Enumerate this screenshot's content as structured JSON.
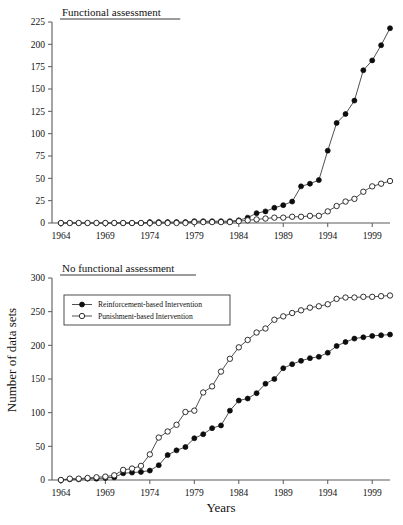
{
  "figure": {
    "ylabel": "Number of data sets",
    "xlabel": "Years"
  },
  "legend": {
    "items": [
      {
        "label": "Reinforcement-based Intervention",
        "marker": "filled-circle"
      },
      {
        "label": "Punishment-based Intervention",
        "marker": "open-circle"
      }
    ]
  },
  "chart_data": [
    {
      "type": "line",
      "title": "Functional assessment",
      "xlabel": "Years",
      "ylabel": "Number of data sets",
      "xlim": [
        1963,
        2001
      ],
      "ylim": [
        0,
        225
      ],
      "yticks": [
        0,
        25,
        50,
        75,
        100,
        125,
        150,
        175,
        200,
        225
      ],
      "xticks": [
        1964,
        1969,
        1974,
        1979,
        1984,
        1989,
        1994,
        1999
      ],
      "grid": false,
      "legend_position": "none",
      "x": [
        1964,
        1965,
        1966,
        1967,
        1968,
        1969,
        1970,
        1971,
        1972,
        1973,
        1974,
        1975,
        1976,
        1977,
        1978,
        1979,
        1980,
        1981,
        1982,
        1983,
        1984,
        1985,
        1986,
        1987,
        1988,
        1989,
        1990,
        1991,
        1992,
        1993,
        1994,
        1995,
        1996,
        1997,
        1998,
        1999,
        2000,
        2001
      ],
      "series": [
        {
          "name": "Reinforcement-based Intervention",
          "marker": "filled-circle",
          "values": [
            0,
            0,
            0,
            0,
            0,
            0,
            0,
            0,
            0,
            0,
            1,
            1,
            1,
            1,
            1,
            2,
            2,
            2,
            2,
            2,
            3,
            6,
            11,
            13,
            17,
            20,
            24,
            41,
            44,
            48,
            81,
            112,
            122,
            137,
            171,
            182,
            199,
            218
          ]
        },
        {
          "name": "Punishment-based Intervention",
          "marker": "open-circle",
          "values": [
            0,
            0,
            0,
            0,
            0,
            0,
            0,
            0,
            0,
            0,
            0,
            0,
            0,
            0,
            0,
            1,
            1,
            1,
            1,
            1,
            2,
            3,
            4,
            5,
            6,
            6,
            7,
            7,
            8,
            8,
            13,
            19,
            24,
            27,
            35,
            41,
            44,
            47
          ]
        }
      ]
    },
    {
      "type": "line",
      "title": "No functional assessment",
      "xlabel": "Years",
      "ylabel": "Number of data sets",
      "xlim": [
        1963,
        2001
      ],
      "ylim": [
        0,
        300
      ],
      "yticks": [
        0,
        50,
        100,
        150,
        200,
        250,
        300
      ],
      "xticks": [
        1964,
        1969,
        1974,
        1979,
        1984,
        1989,
        1994,
        1999
      ],
      "grid": false,
      "legend_position": "upper-left",
      "x": [
        1964,
        1965,
        1966,
        1967,
        1968,
        1969,
        1970,
        1971,
        1972,
        1973,
        1974,
        1975,
        1976,
        1977,
        1978,
        1979,
        1980,
        1981,
        1982,
        1983,
        1984,
        1985,
        1986,
        1987,
        1988,
        1989,
        1990,
        1991,
        1992,
        1993,
        1994,
        1995,
        1996,
        1997,
        1998,
        1999,
        2000,
        2001
      ],
      "series": [
        {
          "name": "Reinforcement-based Intervention",
          "marker": "filled-circle",
          "values": [
            0,
            1,
            1,
            2,
            2,
            3,
            4,
            10,
            11,
            12,
            14,
            22,
            37,
            44,
            49,
            62,
            68,
            77,
            81,
            103,
            118,
            121,
            129,
            143,
            150,
            166,
            172,
            177,
            181,
            183,
            189,
            199,
            205,
            210,
            212,
            214,
            215,
            216
          ]
        },
        {
          "name": "Punishment-based Intervention",
          "marker": "open-circle",
          "values": [
            0,
            2,
            2,
            3,
            4,
            5,
            7,
            15,
            17,
            21,
            38,
            63,
            72,
            82,
            101,
            103,
            130,
            139,
            161,
            180,
            197,
            208,
            219,
            225,
            238,
            243,
            248,
            252,
            256,
            258,
            261,
            269,
            271,
            271,
            272,
            272,
            273,
            274
          ]
        }
      ]
    }
  ]
}
